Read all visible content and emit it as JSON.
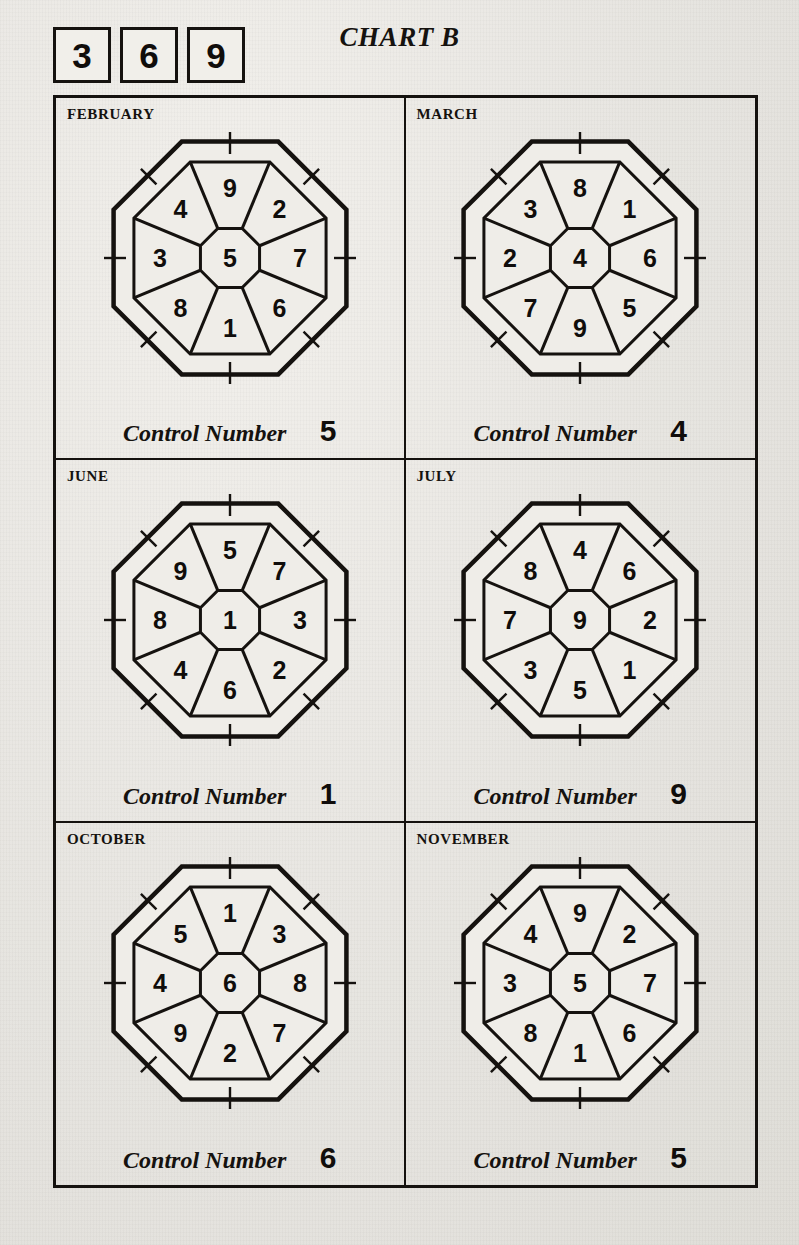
{
  "header": {
    "title": "CHART B",
    "code_boxes": [
      "3",
      "6",
      "9"
    ]
  },
  "footer_label": "Control Number",
  "chart_data": {
    "type": "diagram",
    "title": "CHART B",
    "code_boxes": [
      "3",
      "6",
      "9"
    ],
    "sector_order": [
      "N",
      "NE",
      "E",
      "SE",
      "S",
      "SW",
      "W",
      "NW"
    ],
    "panels": [
      {
        "month": "FEBRUARY",
        "center": "5",
        "sectors": [
          "9",
          "2",
          "7",
          "6",
          "1",
          "8",
          "3",
          "4"
        ],
        "control_label": "Control Number",
        "control_number": "5"
      },
      {
        "month": "MARCH",
        "center": "4",
        "sectors": [
          "8",
          "1",
          "6",
          "5",
          "9",
          "7",
          "2",
          "3"
        ],
        "control_label": "Control Number",
        "control_number": "4"
      },
      {
        "month": "JUNE",
        "center": "1",
        "sectors": [
          "5",
          "7",
          "3",
          "2",
          "6",
          "4",
          "8",
          "9"
        ],
        "control_label": "Control Number",
        "control_number": "1"
      },
      {
        "month": "JULY",
        "center": "9",
        "sectors": [
          "4",
          "6",
          "2",
          "1",
          "5",
          "3",
          "7",
          "8"
        ],
        "control_label": "Control Number",
        "control_number": "9"
      },
      {
        "month": "OCTOBER",
        "center": "6",
        "sectors": [
          "1",
          "3",
          "8",
          "7",
          "2",
          "9",
          "4",
          "5"
        ],
        "control_label": "Control Number",
        "control_number": "6"
      },
      {
        "month": "NOVEMBER",
        "center": "5",
        "sectors": [
          "9",
          "2",
          "7",
          "6",
          "1",
          "8",
          "3",
          "4"
        ],
        "control_label": "Control Number",
        "control_number": "5"
      }
    ],
    "colors": {
      "ink": "#15120f",
      "paper": "#e9e7e2"
    }
  }
}
